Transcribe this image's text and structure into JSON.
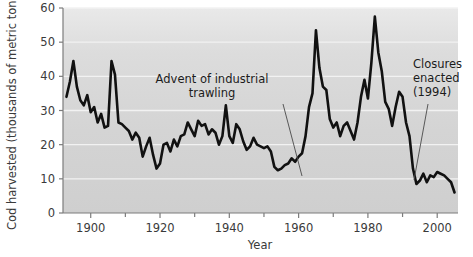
{
  "chart_data": {
    "type": "line",
    "title": "",
    "xlabel": "Year",
    "ylabel": "Cod harvested (thousands of metric tons)",
    "xlim": [
      1892,
      2006
    ],
    "ylim": [
      0,
      60
    ],
    "xticks": [
      1900,
      1920,
      1940,
      1960,
      1980,
      2000
    ],
    "xtick_labels": [
      "1900",
      "1920",
      "1940",
      "1960",
      "1980",
      "2000"
    ],
    "yticks": [
      0,
      10,
      20,
      30,
      40,
      50,
      60
    ],
    "ytick_labels": [
      "0",
      "10",
      "20",
      "30",
      "40",
      "50",
      "60"
    ],
    "xminor_step": 10,
    "grid": "horizontal-white",
    "legend": null,
    "line_color": "#111111",
    "line_width": 2.6,
    "plot_background": "#d5d5d5",
    "series": [
      {
        "name": "Cod harvested",
        "x": [
          1893,
          1894,
          1895,
          1896,
          1897,
          1898,
          1899,
          1900,
          1901,
          1902,
          1903,
          1904,
          1905,
          1906,
          1907,
          1908,
          1909,
          1910,
          1911,
          1912,
          1913,
          1914,
          1915,
          1916,
          1917,
          1918,
          1919,
          1920,
          1921,
          1922,
          1923,
          1924,
          1925,
          1926,
          1927,
          1928,
          1929,
          1930,
          1931,
          1932,
          1933,
          1934,
          1935,
          1936,
          1937,
          1938,
          1939,
          1940,
          1941,
          1942,
          1943,
          1944,
          1945,
          1946,
          1947,
          1948,
          1949,
          1950,
          1951,
          1952,
          1953,
          1954,
          1955,
          1956,
          1957,
          1958,
          1959,
          1960,
          1961,
          1962,
          1963,
          1964,
          1965,
          1966,
          1967,
          1968,
          1969,
          1970,
          1971,
          1972,
          1973,
          1974,
          1975,
          1976,
          1977,
          1978,
          1979,
          1980,
          1981,
          1982,
          1983,
          1984,
          1985,
          1986,
          1987,
          1988,
          1989,
          1990,
          1991,
          1992,
          1993,
          1994,
          1995,
          1996,
          1997,
          1998,
          1999,
          2000,
          2001,
          2002,
          2003,
          2004,
          2005
        ],
        "y": [
          34.0,
          38.5,
          44.5,
          37.0,
          33.0,
          31.5,
          34.5,
          29.5,
          31.0,
          26.5,
          29.0,
          25.0,
          25.5,
          44.5,
          40.5,
          26.5,
          26.0,
          25.0,
          24.0,
          21.5,
          23.5,
          22.0,
          16.5,
          19.5,
          22.0,
          17.0,
          13.0,
          14.5,
          20.0,
          20.5,
          18.0,
          21.5,
          19.5,
          22.5,
          23.0,
          26.5,
          24.5,
          22.5,
          27.0,
          25.5,
          26.0,
          23.0,
          24.5,
          23.5,
          20.0,
          22.5,
          31.5,
          22.5,
          20.5,
          26.0,
          24.5,
          21.0,
          18.5,
          19.5,
          22.0,
          20.0,
          19.5,
          19.0,
          19.5,
          18.0,
          13.5,
          12.5,
          13.0,
          14.0,
          14.5,
          16.0,
          15.0,
          16.5,
          17.5,
          22.5,
          31.0,
          35.0,
          53.5,
          42.5,
          37.0,
          36.0,
          27.5,
          25.0,
          26.5,
          22.5,
          25.5,
          26.5,
          24.0,
          21.5,
          26.5,
          34.0,
          39.0,
          33.5,
          44.0,
          57.5,
          47.0,
          41.5,
          32.5,
          30.5,
          25.5,
          31.0,
          35.5,
          34.0,
          26.5,
          22.5,
          13.0,
          8.5,
          9.5,
          11.5,
          9.0,
          11.0,
          10.5,
          12.0,
          11.5,
          11.0,
          10.0,
          9.0,
          6.0
        ]
      }
    ],
    "annotations": [
      {
        "id": "advent-of-industrial-trawling",
        "label_lines": [
          "Advent of industrial",
          "trawling"
        ],
        "text_x_px": 212,
        "text_y_px": 83,
        "leader_from_px": [
          283,
          104
        ],
        "leader_to_px": [
          302,
          176
        ]
      },
      {
        "id": "closures-enacted-1994",
        "label_lines": [
          "Closures",
          "enacted",
          "(1994)"
        ],
        "text_x_px": 413,
        "text_y_px": 68,
        "leader_from_px": [
          428,
          104
        ],
        "leader_to_px": [
          414,
          180
        ]
      }
    ]
  },
  "axes": {
    "y_axis_title": "Cod harvested (thousands of metric tons)",
    "x_axis_title": "Year"
  }
}
